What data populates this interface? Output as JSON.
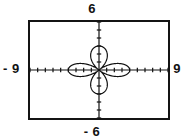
{
  "window": {
    "xmin_label": "- 9",
    "xmax_label": "9",
    "ymin_label": "- 6",
    "ymax_label": "6"
  },
  "chart_data": {
    "type": "line",
    "title": "",
    "subtitle": "",
    "xlabel": "",
    "ylabel": "",
    "xlim": [
      -9,
      9
    ],
    "ylim": [
      -6,
      6
    ],
    "grid": false,
    "legend": null,
    "axes": {
      "x_axis_visible": true,
      "y_axis_visible": true,
      "x_tick_spacing": 1,
      "y_tick_spacing": 1,
      "x_ticks": [
        -9,
        -8,
        -7,
        -6,
        -5,
        -4,
        -3,
        -2,
        -1,
        0,
        1,
        2,
        3,
        4,
        5,
        6,
        7,
        8,
        9
      ],
      "y_ticks": [
        -6,
        -5,
        -4,
        -3,
        -2,
        -1,
        0,
        1,
        2,
        3,
        4,
        5,
        6
      ],
      "tick_style": "hash-marks"
    },
    "annotations": [
      {
        "text": "6",
        "position": "above-screen-center",
        "meaning": "Ymax"
      },
      {
        "text": "- 6",
        "position": "below-screen-center",
        "meaning": "Ymin"
      },
      {
        "text": "- 9",
        "position": "left-of-screen",
        "meaning": "Xmin"
      },
      {
        "text": "9",
        "position": "right-of-screen",
        "meaning": "Xmax"
      }
    ],
    "curve": {
      "name": "four-petal rose",
      "equation_polar": "r = 4 cos(2θ)",
      "petal_count": 4,
      "petal_orientation": "along-axes",
      "petal_length_x": 4,
      "petal_length_y": 3,
      "center": [
        0,
        0
      ],
      "stroke": "#111111",
      "stroke_width": 1.2
    },
    "series": [
      {
        "name": "four-petal rose",
        "points_polar_theta_deg": [
          0,
          15,
          30,
          45,
          60,
          75,
          90,
          105,
          120,
          135,
          150,
          165,
          180,
          195,
          210,
          225,
          240,
          255,
          270,
          285,
          300,
          315,
          330,
          345,
          360
        ],
        "points_polar_r": [
          4,
          3.46,
          2,
          0,
          -2,
          -3.46,
          -4,
          -3.46,
          -2,
          0,
          2,
          3.46,
          4,
          3.46,
          2,
          0,
          -2,
          -3.46,
          -4,
          -3.46,
          -2,
          0,
          2,
          3.46,
          4
        ]
      }
    ]
  },
  "colors": {
    "frame": "#141414",
    "curve": "#111111",
    "axis": "#111111",
    "background": "#ffffff",
    "text": "#111111"
  }
}
